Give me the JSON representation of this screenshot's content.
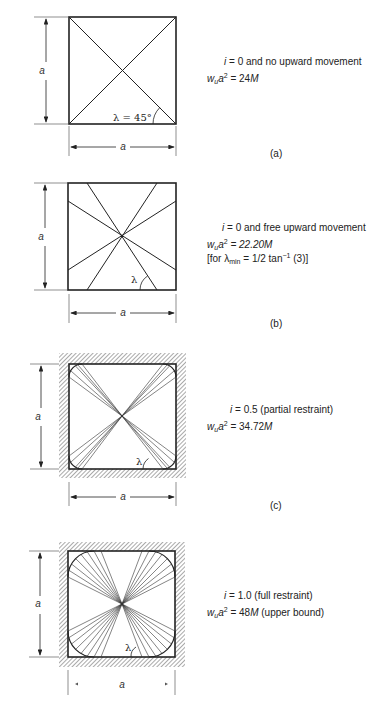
{
  "figure": {
    "panels": [
      {
        "id": "a",
        "caption": "(a)",
        "condition_var": "i",
        "condition_text": " = 0 and no upward movement",
        "load_lhs": "w",
        "load_sub": "u",
        "load_a": "a",
        "load_exp": "2",
        "load_rhs_num": " = 24",
        "load_rhs_M": "M",
        "load_suffix": "",
        "angle_label": "λ = 45°",
        "dim_vertical": "a",
        "dim_horizontal": "a",
        "edge_restraint": "none",
        "yield_pattern": "diagonal"
      },
      {
        "id": "b",
        "caption": "(b)",
        "condition_var": "i",
        "condition_text": " = 0 and free upward movement",
        "load_lhs": "w",
        "load_sub": "u",
        "load_a": "a",
        "load_exp": "2",
        "load_rhs_num": " = 22.20",
        "load_rhs_M": "M",
        "load_suffix": "",
        "note_prefix": "[for λ",
        "note_sub": "min",
        "note_mid": " = 1/2 tan",
        "note_exp": "−1",
        "note_suffix": " (3)]",
        "angle_label": "λ",
        "dim_vertical": "a",
        "dim_horizontal": "a",
        "edge_restraint": "none",
        "yield_pattern": "corner-levers"
      },
      {
        "id": "c",
        "caption": "(c)",
        "condition_var": "i",
        "condition_text": " = 0.5 (partial restraint)",
        "load_lhs": "w",
        "load_sub": "u",
        "load_a": "a",
        "load_exp": "2",
        "load_rhs_num": " = 34.72",
        "load_rhs_M": "M",
        "load_suffix": "",
        "angle_label": "λ",
        "dim_vertical": "a",
        "dim_horizontal": "a",
        "edge_restraint": "fixed (hatched)",
        "yield_pattern": "corner-fans-small"
      },
      {
        "id": "d",
        "caption": "",
        "condition_var": "i",
        "condition_text": " = 1.0 (full restraint)",
        "load_lhs": "w",
        "load_sub": "u",
        "load_a": "a",
        "load_exp": "2",
        "load_rhs_num": " = 48",
        "load_rhs_M": "M",
        "load_suffix": " (upper bound)",
        "angle_label": "λ",
        "dim_vertical": "a",
        "dim_horizontal": "a",
        "edge_restraint": "fixed (hatched)",
        "yield_pattern": "corner-fans-large"
      }
    ]
  }
}
